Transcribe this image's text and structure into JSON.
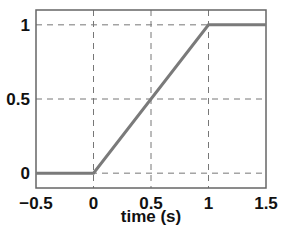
{
  "chart_data": {
    "type": "line",
    "title": "",
    "xlabel": "time (s)",
    "ylabel": "",
    "xlim": [
      -0.5,
      1.5
    ],
    "ylim": [
      -0.1,
      1.1
    ],
    "xticks": [
      -0.5,
      0,
      0.5,
      1,
      1.5
    ],
    "xtick_labels": [
      "−0.5",
      "0",
      "0.5",
      "1",
      "1.5"
    ],
    "yticks": [
      0,
      0.5,
      1
    ],
    "ytick_labels": [
      "0",
      "0.5",
      "1"
    ],
    "grid": true,
    "grid_style": "dashed",
    "legend": null,
    "series": [
      {
        "name": "ramp",
        "color": "#7a7a7a",
        "x": [
          -0.5,
          0,
          1,
          1.5
        ],
        "y": [
          0,
          0,
          1,
          1
        ]
      }
    ]
  }
}
